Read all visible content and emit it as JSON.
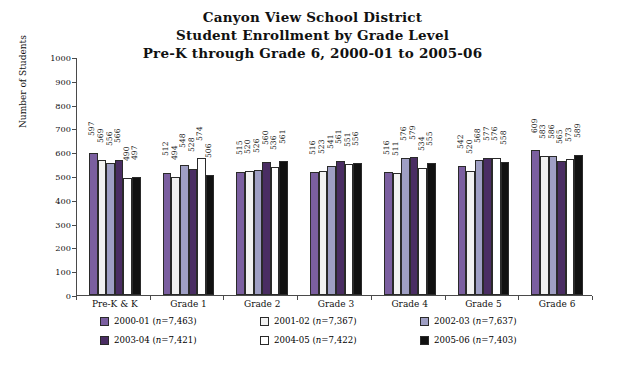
{
  "chart_data": {
    "type": "bar",
    "title": "Canyon View School District",
    "subtitle": "Student Enrollment by Grade Level",
    "subtitle2": "Pre-K through Grade 6, 2000-01 to 2005-06",
    "xlabel": "",
    "ylabel": "Number of Students",
    "ylim": [
      0,
      1000
    ],
    "yticks": [
      0,
      100,
      200,
      300,
      400,
      500,
      600,
      700,
      800,
      900,
      1000
    ],
    "grid": false,
    "legend_position": "bottom",
    "categories": [
      "Pre-K & K",
      "Grade 1",
      "Grade 2",
      "Grade 3",
      "Grade 4",
      "Grade 5",
      "Grade 6"
    ],
    "series": [
      {
        "name": "2000-01",
        "n": "7,463",
        "color": "#7b5fa0",
        "values": [
          597,
          512,
          515,
          516,
          516,
          542,
          609
        ]
      },
      {
        "name": "2001-02",
        "n": "7,367",
        "color": "#f2f2f2",
        "values": [
          569,
          494,
          520,
          523,
          511,
          520,
          583
        ]
      },
      {
        "name": "2002-03",
        "n": "7,637",
        "color": "#9f9fc4",
        "values": [
          556,
          548,
          526,
          541,
          576,
          568,
          586
        ]
      },
      {
        "name": "2003-04",
        "n": "7,421",
        "color": "#4a2d63",
        "values": [
          566,
          528,
          560,
          561,
          579,
          577,
          565
        ]
      },
      {
        "name": "2004-05",
        "n": "7,422",
        "color": "#ffffff",
        "values": [
          490,
          574,
          536,
          551,
          534,
          576,
          573
        ]
      },
      {
        "name": "2005-06",
        "n": "7,403",
        "color": "#111111",
        "values": [
          497,
          506,
          561,
          556,
          555,
          558,
          589
        ]
      }
    ],
    "legend_entries": [
      {
        "label": "2000-01",
        "n": "(n=7,463)",
        "color": "#7b5fa0"
      },
      {
        "label": "2001-02",
        "n": "(n=7,367)",
        "color": "#f2f2f2"
      },
      {
        "label": "2002-03",
        "n": "(n=7,637)",
        "color": "#9f9fc4"
      },
      {
        "label": "2003-04",
        "n": "(n=7,421)",
        "color": "#4a2d63"
      },
      {
        "label": "2004-05",
        "n": "(n=7,422)",
        "color": "#ffffff"
      },
      {
        "label": "2005-06",
        "n": "(n=7,403)",
        "color": "#111111"
      }
    ]
  }
}
